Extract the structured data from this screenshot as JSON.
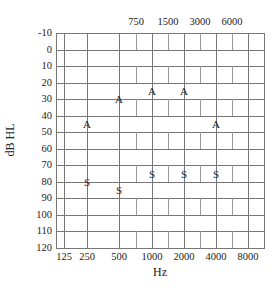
{
  "chart_data": {
    "type": "scatter",
    "title": "",
    "xlabel": "Hz",
    "ylabel": "dB HL",
    "x_scale": "log2 (octave)",
    "x_ticks_bottom": [
      "125",
      "250",
      "500",
      "1000",
      "2000",
      "4000",
      "8000"
    ],
    "x_ticks_top": [
      "750",
      "1500",
      "3000",
      "6000"
    ],
    "y_ticks": [
      "-10",
      "0",
      "10",
      "20",
      "30",
      "40",
      "50",
      "60",
      "70",
      "80",
      "90",
      "100",
      "110",
      "120"
    ],
    "ylim": [
      -10,
      120
    ],
    "y_inverted": true,
    "grid": true,
    "series": [
      {
        "name": "A",
        "marker": "A",
        "x": [
          250,
          500,
          1000,
          2000,
          4000
        ],
        "values": [
          45,
          30,
          25,
          25,
          45
        ]
      },
      {
        "name": "S",
        "marker": "S",
        "x": [
          250,
          500,
          1000,
          2000,
          4000
        ],
        "values": [
          80,
          85,
          75,
          75,
          75
        ]
      }
    ]
  },
  "labels": {
    "x_axis_title": "Hz",
    "y_axis_title": "dB HL"
  }
}
